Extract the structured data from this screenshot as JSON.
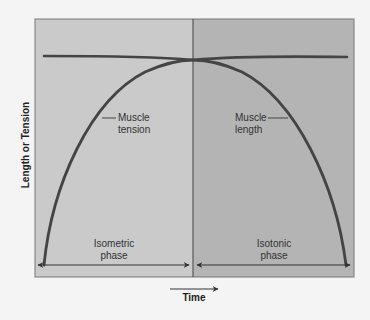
{
  "diagram": {
    "y_axis_label": "Length or Tension",
    "x_axis_label": "Time",
    "phases": [
      {
        "name": "isometric",
        "label_line1": "Isometric",
        "label_line2": "phase",
        "color": "#cacaca"
      },
      {
        "name": "isotonic",
        "label_line1": "Isotonic",
        "label_line2": "phase",
        "color": "#b4b4b4"
      }
    ],
    "curves": [
      {
        "name": "muscle-tension",
        "label_line1": "Muscle",
        "label_line2": "tension"
      },
      {
        "name": "muscle-length",
        "label_line1": "Muscle",
        "label_line2": "length"
      }
    ],
    "colors": {
      "background": "#f4f4f4",
      "stroke": "#444444",
      "border": "#666666",
      "text": "#333333"
    }
  }
}
